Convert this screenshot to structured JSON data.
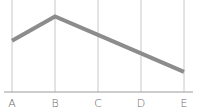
{
  "chart_data": {
    "type": "line",
    "title": "",
    "xlabel": "",
    "ylabel": "",
    "categories": [
      "A",
      "B",
      "C",
      "D",
      "E"
    ],
    "series": [
      {
        "name": "Series 1",
        "values": [
          61,
          90,
          68,
          46,
          24
        ],
        "color": "#8c8c8c"
      }
    ],
    "ylim": [
      0,
      100
    ],
    "grid": "vertical",
    "legend": "none"
  }
}
